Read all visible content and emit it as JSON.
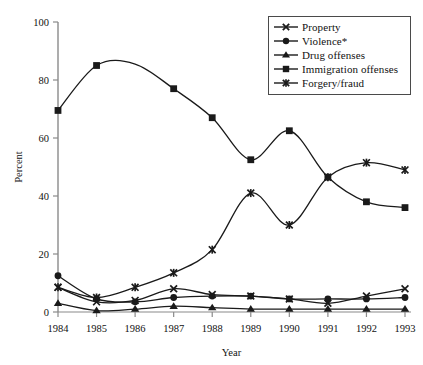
{
  "chart_data": {
    "type": "line",
    "title": "",
    "xlabel": "Year",
    "ylabel": "Percent",
    "grid": false,
    "legend_position": "top-right",
    "x": [
      1984,
      1985,
      1986,
      1987,
      1988,
      1989,
      1990,
      1991,
      1992,
      1993
    ],
    "xtick_labels": [
      "1984",
      "1985",
      "1986",
      "1987",
      "1988",
      "1989",
      "1990",
      "1991",
      "1992",
      "1993"
    ],
    "ytick_labels": [
      "0",
      "20",
      "40",
      "60",
      "80",
      "100"
    ],
    "yticks": [
      0,
      20,
      40,
      60,
      80,
      100
    ],
    "ylim": [
      0,
      100
    ],
    "xlim": [
      1984,
      1993
    ],
    "series": [
      {
        "name": "Property",
        "marker": "x-cross",
        "values": [
          8.5,
          3.5,
          4.0,
          8.0,
          6.0,
          5.5,
          4.5,
          3.0,
          5.5,
          8.0
        ]
      },
      {
        "name": "Violence*",
        "marker": "circle",
        "values": [
          12.5,
          4.5,
          3.5,
          5.0,
          5.5,
          5.5,
          4.5,
          4.5,
          4.5,
          5.0
        ]
      },
      {
        "name": "Drug offenses",
        "marker": "triangle",
        "values": [
          3.0,
          0.5,
          1.0,
          2.0,
          1.5,
          1.0,
          1.0,
          1.0,
          1.0,
          1.0
        ]
      },
      {
        "name": "Immigration offenses",
        "marker": "square",
        "values": [
          69.5,
          85.0,
          85.5,
          77.0,
          67.0,
          52.5,
          62.5,
          46.5,
          38.0,
          36.0
        ]
      },
      {
        "name": "Forgery/fraud",
        "marker": "asterisk",
        "values": [
          8.5,
          5.0,
          8.5,
          13.5,
          21.5,
          41.0,
          30.0,
          46.5,
          51.5,
          49.0
        ]
      }
    ]
  },
  "legend": {
    "entries": [
      {
        "label": "Property"
      },
      {
        "label": "Violence*"
      },
      {
        "label": "Drug offenses"
      },
      {
        "label": "Immigration offenses"
      },
      {
        "label": "Forgery/fraud"
      }
    ]
  },
  "axes": {
    "y_axis_title": "Percent",
    "x_axis_title": "Year"
  }
}
